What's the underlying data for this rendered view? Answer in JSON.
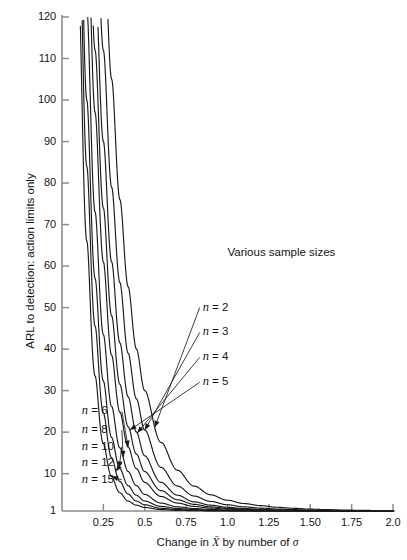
{
  "chart_data": {
    "type": "line",
    "title": "",
    "xlabel": "Change in X̄ by number of σ",
    "ylabel": "ARL to detection: action limits only",
    "xlim": [
      0,
      2.0
    ],
    "ylim": [
      1,
      120
    ],
    "grid": false,
    "legend_position": "inline-annotations",
    "legend_title": "Various sample sizes",
    "xticks": [
      "0.25",
      "0.5",
      "0.75",
      "1.0",
      "1.25",
      "1.50",
      "1.75",
      "2.0"
    ],
    "xtick_values": [
      0.25,
      0.5,
      0.75,
      1.0,
      1.25,
      1.5,
      1.75,
      2.0
    ],
    "yticks": [
      "1",
      "10",
      "20",
      "30",
      "40",
      "50",
      "60",
      "70",
      "80",
      "90",
      "100",
      "110",
      "120"
    ],
    "ytick_values": [
      1,
      10,
      20,
      30,
      40,
      50,
      60,
      70,
      80,
      90,
      100,
      110,
      120
    ],
    "x": [
      0.1,
      0.15,
      0.2,
      0.25,
      0.3,
      0.35,
      0.4,
      0.45,
      0.5,
      0.6,
      0.7,
      0.8,
      0.9,
      1.0,
      1.1,
      1.2,
      1.3,
      1.4,
      1.5,
      1.6,
      1.7,
      1.8,
      1.9,
      2.0
    ],
    "series": [
      {
        "name": "n = 2",
        "label": "n = 2",
        "values": [
          320,
          250,
          190,
          143,
          105,
          76,
          55,
          40,
          30,
          17.5,
          10.8,
          7.0,
          4.9,
          3.6,
          2.8,
          2.3,
          1.9,
          1.65,
          1.45,
          1.33,
          1.24,
          1.17,
          1.12,
          1.09
        ]
      },
      {
        "name": "n = 3",
        "label": "n = 3",
        "values": [
          290,
          215,
          155,
          112,
          79,
          56,
          39,
          28,
          20.5,
          11.5,
          7.0,
          4.6,
          3.3,
          2.5,
          2.0,
          1.7,
          1.48,
          1.33,
          1.23,
          1.16,
          1.11,
          1.08,
          1.05,
          1.04
        ]
      },
      {
        "name": "n = 4",
        "label": "n = 4",
        "values": [
          265,
          190,
          131,
          90,
          61,
          41.5,
          28.5,
          20,
          14.3,
          7.9,
          4.8,
          3.2,
          2.4,
          1.9,
          1.6,
          1.4,
          1.27,
          1.18,
          1.12,
          1.08,
          1.05,
          1.03,
          1.02,
          1.01
        ]
      },
      {
        "name": "n = 5",
        "label": "n = 5",
        "values": [
          245,
          168,
          112,
          74,
          48,
          31.5,
          21.3,
          14.7,
          10.5,
          5.9,
          3.7,
          2.6,
          2.0,
          1.65,
          1.42,
          1.27,
          1.18,
          1.12,
          1.08,
          1.05,
          1.03,
          1.02,
          1.01,
          1.01
        ]
      },
      {
        "name": "n = 6",
        "label": "n = 6",
        "values": [
          228,
          150,
          97,
          61,
          38.5,
          24.8,
          16.4,
          11.2,
          7.9,
          4.5,
          2.9,
          2.1,
          1.7,
          1.45,
          1.29,
          1.18,
          1.12,
          1.08,
          1.05,
          1.03,
          1.02,
          1.01,
          1.01,
          1.0
        ]
      },
      {
        "name": "n = 8",
        "label": "n = 8",
        "values": [
          198,
          122,
          73,
          43.5,
          26.2,
          16.2,
          10.5,
          7.1,
          5.0,
          2.9,
          2.0,
          1.6,
          1.37,
          1.22,
          1.13,
          1.08,
          1.05,
          1.03,
          1.02,
          1.01,
          1.01,
          1.0,
          1.0,
          1.0
        ]
      },
      {
        "name": "n = 10",
        "label": "n = 10",
        "values": [
          173,
          100,
          57,
          32.3,
          18.7,
          11.2,
          7.1,
          4.8,
          3.4,
          2.1,
          1.6,
          1.34,
          1.19,
          1.11,
          1.06,
          1.04,
          1.02,
          1.01,
          1.01,
          1.0,
          1.0,
          1.0,
          1.0,
          1.0
        ]
      },
      {
        "name": "n = 12",
        "label": "n = 12",
        "values": [
          153,
          84,
          45.5,
          24.6,
          13.8,
          8.1,
          5.1,
          3.4,
          2.5,
          1.65,
          1.33,
          1.18,
          1.09,
          1.05,
          1.03,
          1.01,
          1.01,
          1.0,
          1.0,
          1.0,
          1.0,
          1.0,
          1.0,
          1.0
        ]
      },
      {
        "name": "n = 15",
        "label": "n = 15",
        "values": [
          128,
          66,
          33.5,
          17.2,
          9.3,
          5.4,
          3.4,
          2.4,
          1.85,
          1.34,
          1.15,
          1.07,
          1.03,
          1.02,
          1.01,
          1.0,
          1.0,
          1.0,
          1.0,
          1.0,
          1.0,
          1.0,
          1.0,
          1.0
        ]
      }
    ],
    "annotations": [
      {
        "text": "Various sample sizes",
        "x": 1.0,
        "y": 63
      },
      {
        "text": "n = 2",
        "x": 0.85,
        "y": 50
      },
      {
        "text": "n = 3",
        "x": 0.85,
        "y": 44
      },
      {
        "text": "n = 4",
        "x": 0.85,
        "y": 38
      },
      {
        "text": "n = 5",
        "x": 0.85,
        "y": 32
      },
      {
        "text": "n = 6",
        "x": 0.12,
        "y": 25
      },
      {
        "text": "n = 8",
        "x": 0.12,
        "y": 20.5
      },
      {
        "text": "n = 10",
        "x": 0.12,
        "y": 16.5
      },
      {
        "text": "n = 12",
        "x": 0.12,
        "y": 12.5
      },
      {
        "text": "n = 15",
        "x": 0.12,
        "y": 8.5
      }
    ],
    "colors": {
      "line": "#1a1a1a",
      "axis": "#8c8c8c",
      "text": "#141414",
      "background": "#ffffff"
    }
  }
}
